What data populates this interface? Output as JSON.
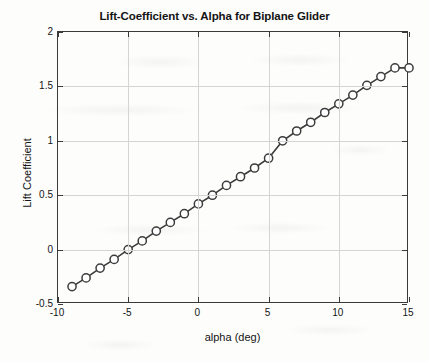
{
  "chart_data": {
    "type": "line",
    "title": "Lift-Coefficient vs. Alpha for Biplane Glider",
    "xlabel": "alpha (deg)",
    "ylabel": "Lift Coefficient",
    "xlim": [
      -10,
      15
    ],
    "ylim": [
      -0.5,
      2
    ],
    "xticks": [
      -10,
      -5,
      0,
      5,
      10,
      15
    ],
    "xticklabels": [
      "-10",
      "-5",
      "0",
      "5",
      "10",
      "15"
    ],
    "yticks": [
      -0.5,
      0,
      0.5,
      1,
      1.5,
      2
    ],
    "yticklabels": [
      "-0.5",
      "0",
      "0.5",
      "1",
      "1.5",
      "2"
    ],
    "grid": true,
    "legend": null,
    "marker": "circle-open",
    "line_color": "#3c3c3c",
    "marker_color": "#3c3c3c",
    "series": [
      {
        "name": "Lift Coefficient",
        "x": [
          -9,
          -8,
          -7,
          -6,
          -5,
          -4,
          -3,
          -2,
          -1,
          0,
          1,
          2,
          3,
          4,
          5,
          6,
          7,
          8,
          9,
          10,
          11,
          12,
          13,
          14,
          15
        ],
        "values": [
          -0.34,
          -0.26,
          -0.17,
          -0.09,
          0.0,
          0.08,
          0.17,
          0.25,
          0.33,
          0.42,
          0.5,
          0.59,
          0.67,
          0.75,
          0.84,
          1.0,
          1.09,
          1.17,
          1.26,
          1.34,
          1.42,
          1.51,
          1.59,
          1.67,
          1.67
        ]
      }
    ]
  },
  "figure": {
    "background_color": "#fdfdfc",
    "axes_color": "#3a3a3a",
    "grid_color": "#d4d4d4"
  }
}
